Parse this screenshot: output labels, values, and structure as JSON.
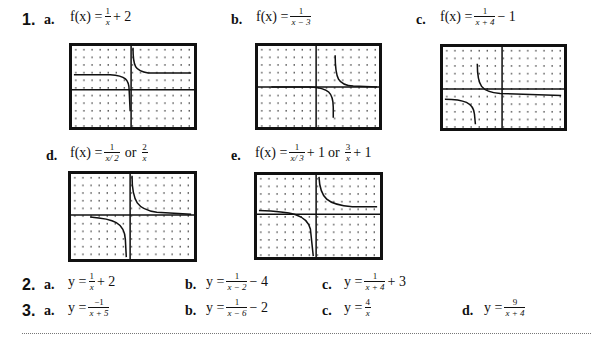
{
  "problem1": {
    "number": "1.",
    "items": [
      {
        "label": "a.",
        "lhs": "f(x) = ",
        "num": "1",
        "den": "x",
        "tail": "+ 2",
        "alt": null,
        "graph": {
          "h_asymptote": 2,
          "v_asymptote": 0
        }
      },
      {
        "label": "b.",
        "lhs": "f(x) = ",
        "num": "1",
        "den": "x − 3",
        "tail": "",
        "alt": null,
        "graph": {
          "h_asymptote": 0,
          "v_asymptote": 3
        }
      },
      {
        "label": "c.",
        "lhs": "f(x) = ",
        "num": "1",
        "den": "x + 4",
        "tail": "− 1",
        "alt": null,
        "graph": {
          "h_asymptote": -1,
          "v_asymptote": -4
        }
      },
      {
        "label": "d.",
        "lhs": "f(x) = ",
        "num": "1",
        "den": "x/ 2",
        "tail": "",
        "or": "or",
        "alt_num": "2",
        "alt_den": "x",
        "alt_tail": "",
        "graph": {
          "h_asymptote": 0,
          "v_asymptote": 0
        }
      },
      {
        "label": "e.",
        "lhs": "f(x) = ",
        "num": "1",
        "den": "x/ 3",
        "tail": "+ 1",
        "or": "or",
        "alt_num": "3",
        "alt_den": "x",
        "alt_tail": "+ 1",
        "graph": {
          "h_asymptote": 1,
          "v_asymptote": 0
        }
      }
    ]
  },
  "problem2": {
    "number": "2.",
    "items": [
      {
        "label": "a.",
        "lhs": "y = ",
        "num": "1",
        "den": "x",
        "tail": "+ 2"
      },
      {
        "label": "b.",
        "lhs": "y = ",
        "num": "1",
        "den": "x − 2",
        "tail": "− 4"
      },
      {
        "label": "c.",
        "lhs": "y = ",
        "num": "1",
        "den": "x + 4",
        "tail": "+ 3"
      }
    ]
  },
  "problem3": {
    "number": "3.",
    "items": [
      {
        "label": "a.",
        "lhs": "y = ",
        "num": "−1",
        "den": "x + 5",
        "tail": ""
      },
      {
        "label": "b.",
        "lhs": "y = ",
        "num": "1",
        "den": "x − 6",
        "tail": "− 2"
      },
      {
        "label": "c.",
        "lhs": "y = ",
        "num": "4",
        "den": "x",
        "tail": ""
      },
      {
        "label": "d.",
        "lhs": "y = ",
        "num": "9",
        "den": "x + 4",
        "tail": ""
      }
    ]
  }
}
